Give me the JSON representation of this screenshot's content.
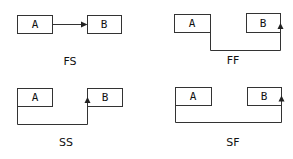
{
  "diagram": {
    "type": "task-dependency-types",
    "colors": {
      "stroke": "#333333",
      "arrow": "#222222",
      "text": "#111111",
      "background": "#ffffff"
    },
    "panels": [
      {
        "id": "fs",
        "label": "FS",
        "task_a": "A",
        "task_b": "B",
        "from": "A finish (right edge)",
        "to": "B start (left edge)"
      },
      {
        "id": "ff",
        "label": "FF",
        "task_a": "A",
        "task_b": "B",
        "from": "A finish (right edge)",
        "to": "B finish (right edge)"
      },
      {
        "id": "ss",
        "label": "SS",
        "task_a": "A",
        "task_b": "B",
        "from": "A start (left edge)",
        "to": "B start (left edge)"
      },
      {
        "id": "sf",
        "label": "SF",
        "task_a": "A",
        "task_b": "B",
        "from": "A start (left edge)",
        "to": "B finish (right edge)"
      }
    ]
  }
}
